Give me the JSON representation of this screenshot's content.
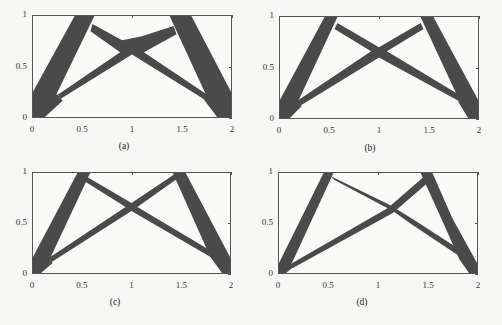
{
  "figure": {
    "fill_color": "#4a4a4a",
    "background": "#fafaf8",
    "axis_color": "#555555"
  },
  "chart_data": [
    {
      "type": "other",
      "subtype": "topology-optimization-layout",
      "caption": "(a)",
      "xlim": [
        0,
        2
      ],
      "ylim": [
        0,
        1
      ],
      "xticks": [
        "0",
        "0.5",
        "1",
        "1.5",
        "2"
      ],
      "yticks": [
        "0",
        "0.5",
        "1"
      ],
      "grid": false,
      "shapes": [
        [
          [
            0,
            0
          ],
          [
            0,
            0.25
          ],
          [
            0.42,
            1
          ],
          [
            0.62,
            1
          ],
          [
            0.2,
            0.15
          ],
          [
            0.12,
            0
          ]
        ],
        [
          [
            0.25,
            0.22
          ],
          [
            0.28,
            0.18
          ],
          [
            1,
            0.62
          ],
          [
            1.72,
            0.18
          ],
          [
            1.76,
            0.22
          ],
          [
            1.12,
            0.64
          ],
          [
            1.45,
            0.82
          ],
          [
            1.42,
            0.9
          ],
          [
            1.1,
            0.8
          ],
          [
            1,
            0.78
          ],
          [
            0.9,
            0.76
          ],
          [
            0.6,
            0.92
          ],
          [
            0.58,
            0.85
          ],
          [
            0.88,
            0.64
          ]
        ],
        [
          [
            1.38,
            1
          ],
          [
            1.6,
            1
          ],
          [
            2,
            0.25
          ],
          [
            2,
            0
          ],
          [
            1.86,
            0
          ],
          [
            1.78,
            0.15
          ]
        ],
        [
          [
            0,
            0
          ],
          [
            0.12,
            0
          ],
          [
            0.3,
            0.16
          ],
          [
            0.25,
            0.22
          ],
          [
            0,
            0.25
          ]
        ],
        [
          [
            1.86,
            0
          ],
          [
            2,
            0
          ],
          [
            2,
            0.25
          ],
          [
            1.74,
            0.22
          ],
          [
            1.72,
            0.18
          ]
        ]
      ]
    },
    {
      "type": "other",
      "subtype": "topology-optimization-layout",
      "caption": "(b)",
      "xlim": [
        0,
        2
      ],
      "ylim": [
        0,
        1
      ],
      "xticks": [
        "0",
        "0.5",
        "1",
        "1.5",
        "2"
      ],
      "yticks": [
        "0",
        "0.5",
        "1"
      ],
      "grid": false,
      "shapes": [
        [
          [
            0,
            0
          ],
          [
            0,
            0.18
          ],
          [
            0.45,
            1
          ],
          [
            0.58,
            1
          ],
          [
            0.2,
            0.2
          ],
          [
            0.1,
            0
          ]
        ],
        [
          [
            0.16,
            0.16
          ],
          [
            0.2,
            0.12
          ],
          [
            1,
            0.6
          ],
          [
            1.82,
            0.16
          ],
          [
            1.86,
            0.2
          ],
          [
            1.08,
            0.66
          ],
          [
            1.45,
            0.88
          ],
          [
            1.42,
            0.94
          ],
          [
            1,
            0.7
          ],
          [
            0.58,
            0.94
          ],
          [
            0.55,
            0.88
          ],
          [
            0.92,
            0.66
          ]
        ],
        [
          [
            1.42,
            1
          ],
          [
            1.55,
            1
          ],
          [
            2,
            0.18
          ],
          [
            2,
            0
          ],
          [
            1.9,
            0
          ],
          [
            1.8,
            0.2
          ]
        ],
        [
          [
            0,
            0
          ],
          [
            0.1,
            0
          ],
          [
            0.22,
            0.12
          ],
          [
            0.16,
            0.16
          ],
          [
            0,
            0.18
          ]
        ],
        [
          [
            1.9,
            0
          ],
          [
            2,
            0
          ],
          [
            2,
            0.18
          ],
          [
            1.84,
            0.2
          ],
          [
            1.8,
            0.16
          ]
        ]
      ]
    },
    {
      "type": "other",
      "subtype": "topology-optimization-layout",
      "caption": "(c)",
      "xlim": [
        0,
        2
      ],
      "ylim": [
        0,
        1
      ],
      "xticks": [
        "0",
        "0.5",
        "1",
        "1.5",
        "2"
      ],
      "yticks": [
        "0",
        "0.5",
        "1"
      ],
      "grid": false,
      "shapes": [
        [
          [
            0,
            0
          ],
          [
            0,
            0.16
          ],
          [
            0.45,
            1
          ],
          [
            0.58,
            1
          ],
          [
            0.18,
            0.16
          ],
          [
            0.08,
            0
          ]
        ],
        [
          [
            0.16,
            0.15
          ],
          [
            0.19,
            0.11
          ],
          [
            1,
            0.62
          ],
          [
            1.82,
            0.15
          ],
          [
            1.86,
            0.19
          ],
          [
            1.06,
            0.66
          ],
          [
            1.46,
            0.94
          ],
          [
            1.44,
            0.99
          ],
          [
            1,
            0.7
          ],
          [
            0.55,
            0.96
          ],
          [
            0.52,
            0.92
          ],
          [
            0.94,
            0.66
          ]
        ],
        [
          [
            1.42,
            1
          ],
          [
            1.55,
            1
          ],
          [
            2,
            0.16
          ],
          [
            2,
            0
          ],
          [
            1.92,
            0
          ],
          [
            1.8,
            0.16
          ]
        ],
        [
          [
            0,
            0
          ],
          [
            0.08,
            0
          ],
          [
            0.2,
            0.1
          ],
          [
            0.16,
            0.15
          ],
          [
            0,
            0.16
          ]
        ],
        [
          [
            1.92,
            0
          ],
          [
            2,
            0
          ],
          [
            2,
            0.16
          ],
          [
            1.85,
            0.19
          ],
          [
            1.82,
            0.15
          ]
        ]
      ]
    },
    {
      "type": "other",
      "subtype": "topology-optimization-layout",
      "caption": "(d)",
      "xlim": [
        0,
        2
      ],
      "ylim": [
        0,
        1
      ],
      "xticks": [
        "0",
        "0.5",
        "1",
        "1.5",
        "2"
      ],
      "yticks": [
        "0",
        "0.5",
        "1"
      ],
      "grid": false,
      "shapes": [
        [
          [
            0,
            0
          ],
          [
            0,
            0.1
          ],
          [
            0.45,
            1
          ],
          [
            0.55,
            1
          ],
          [
            0.14,
            0.12
          ],
          [
            0.07,
            0
          ]
        ],
        [
          [
            0.1,
            0.08
          ],
          [
            0.14,
            0.05
          ],
          [
            1.15,
            0.6
          ],
          [
            1.5,
            0.9
          ],
          [
            1.46,
            0.96
          ],
          [
            1.1,
            0.65
          ]
        ],
        [
          [
            0.52,
            0.97
          ],
          [
            0.56,
            0.93
          ],
          [
            1.15,
            0.62
          ],
          [
            1.35,
            0.48
          ],
          [
            1.85,
            0.15
          ],
          [
            1.88,
            0.2
          ],
          [
            1.35,
            0.54
          ],
          [
            1.12,
            0.68
          ]
        ],
        [
          [
            1.43,
            1
          ],
          [
            1.55,
            1
          ],
          [
            1.75,
            0.55
          ],
          [
            2,
            0.1
          ],
          [
            2,
            0
          ],
          [
            1.92,
            0
          ],
          [
            1.82,
            0.14
          ],
          [
            1.66,
            0.5
          ]
        ],
        [
          [
            0,
            0
          ],
          [
            0.07,
            0
          ],
          [
            0.16,
            0.07
          ],
          [
            0.1,
            0.08
          ],
          [
            0,
            0.1
          ]
        ],
        [
          [
            1.92,
            0
          ],
          [
            2,
            0
          ],
          [
            2,
            0.1
          ],
          [
            1.86,
            0.18
          ],
          [
            1.84,
            0.14
          ]
        ]
      ]
    }
  ]
}
